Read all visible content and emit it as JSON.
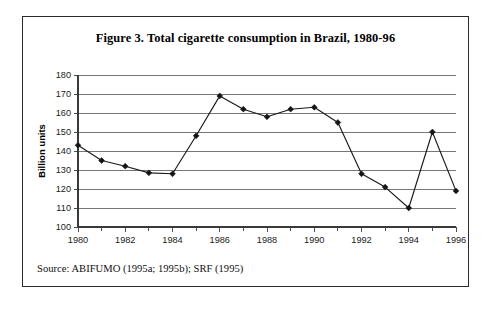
{
  "figure": {
    "title": "Figure 3. Total cigarette consumption in Brazil, 1980-96",
    "source": "Source: ABIFUMO (1995a; 1995b); SRF (1995)"
  },
  "chart_data": {
    "type": "line",
    "title": "Figure 3. Total cigarette consumption in Brazil, 1980-96",
    "xlabel": "",
    "ylabel": "Billion units",
    "x": [
      1980,
      1981,
      1982,
      1983,
      1984,
      1985,
      1986,
      1987,
      1988,
      1989,
      1990,
      1991,
      1992,
      1993,
      1994,
      1995,
      1996
    ],
    "values": [
      143,
      135,
      132,
      128.5,
      128,
      148,
      169,
      162,
      158,
      162,
      163,
      155,
      128,
      121,
      110,
      150,
      119
    ],
    "series": [
      {
        "name": "Total cigarette consumption",
        "values": [
          143,
          135,
          132,
          128.5,
          128,
          148,
          169,
          162,
          158,
          162,
          163,
          155,
          128,
          121,
          110,
          150,
          119
        ]
      }
    ],
    "xlim": [
      1980,
      1996
    ],
    "ylim": [
      100,
      180
    ],
    "ytick_labels": [
      "180",
      "170",
      "160",
      "150",
      "140",
      "130",
      "120",
      "110",
      "100"
    ],
    "ytick_values": [
      180,
      170,
      160,
      150,
      140,
      130,
      120,
      110,
      100
    ],
    "xtick_labels": [
      "1980",
      "1982",
      "1984",
      "1986",
      "1988",
      "1990",
      "1992",
      "1994",
      "1996"
    ],
    "xtick_values": [
      1980,
      1982,
      1984,
      1986,
      1988,
      1990,
      1992,
      1994,
      1996
    ],
    "xtick_minor_values": [
      1981,
      1983,
      1985,
      1987,
      1989,
      1991,
      1993,
      1995
    ],
    "grid": true,
    "legend": false,
    "marker": "diamond",
    "line_color": "#1a1a1a",
    "grid_color": "#676767"
  }
}
